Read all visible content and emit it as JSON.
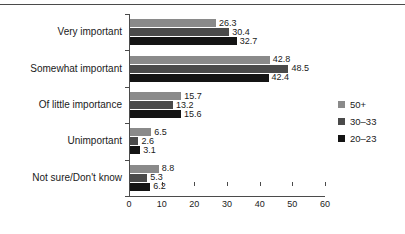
{
  "chart_data": {
    "type": "bar",
    "orientation": "horizontal",
    "title": "",
    "xlabel": "",
    "ylabel": "",
    "xlim": [
      0,
      60
    ],
    "xticks": [
      0,
      10,
      20,
      30,
      40,
      50,
      60
    ],
    "grid": false,
    "legend_position": "right",
    "categories": [
      "Very important",
      "Somewhat important",
      "Of little importance",
      "Unimportant",
      "Not sure/Don't know"
    ],
    "series": [
      {
        "name": "50+",
        "color": "#8a8a8a",
        "values": [
          26.3,
          42.8,
          15.7,
          6.5,
          8.8
        ]
      },
      {
        "name": "30–33",
        "color": "#4a4a4a",
        "values": [
          30.4,
          48.5,
          13.2,
          2.6,
          5.3
        ]
      },
      {
        "name": "20–23",
        "color": "#141414",
        "values": [
          32.7,
          42.4,
          15.6,
          3.1,
          6.2
        ]
      }
    ],
    "value_labels": [
      [
        "26.3",
        "30.4",
        "32.7"
      ],
      [
        "42.8",
        "48.5",
        "42.4"
      ],
      [
        "15.7",
        "13.2",
        "15.6"
      ],
      [
        "6.5",
        "2.6",
        "3.1"
      ],
      [
        "8.8",
        "5.3",
        "6.2"
      ]
    ],
    "xtick_labels": [
      "0",
      "10",
      "20",
      "30",
      "40",
      "50",
      "60"
    ]
  }
}
